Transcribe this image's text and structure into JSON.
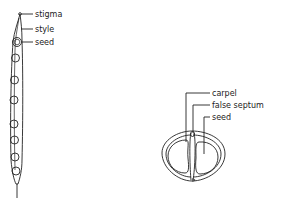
{
  "diagram": {
    "pod_longitudinal": {
      "labels": [
        "stigma",
        "style",
        "seed"
      ],
      "seed_count": 8
    },
    "pod_cross_section": {
      "labels": [
        "carpel",
        "false septum",
        "seed"
      ]
    }
  }
}
